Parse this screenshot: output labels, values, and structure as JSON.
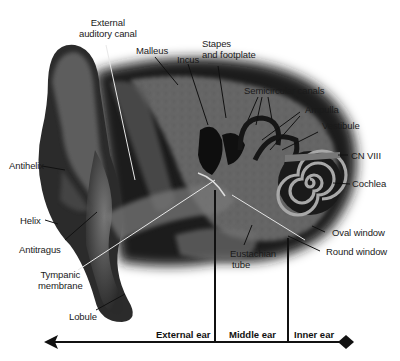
{
  "labels": {
    "external_auditory_canal": "External\nauditory canal",
    "external_auditory_canal_l1": "External",
    "external_auditory_canal_l2": "auditory canal",
    "malleus": "Malleus",
    "incus": "Incus",
    "stapes_l1": "Stapes",
    "stapes_l2": "and footplate",
    "semicircular_canals": "Semicircular canals",
    "ampulla": "Ampulla",
    "vestibule": "Vestibule",
    "cn_viii": "CN VIII",
    "cochlea": "Cochlea",
    "oval_window": "Oval window",
    "round_window": "Round window",
    "eustachian_l1": "Eustachian",
    "eustachian_l2": "tube",
    "antihelix": "Antihelix",
    "helix": "Helix",
    "antitragus": "Antitragus",
    "tympanic_l1": "Tympanic",
    "tympanic_l2": "membrane",
    "lobule": "Lobule"
  },
  "regions": {
    "external": "External ear",
    "middle": "Middle ear",
    "inner": "Inner ear"
  },
  "colors": {
    "background": "#ffffff",
    "ear_dark": "#1c1c1c",
    "ear_mid": "#4a4a4a",
    "bone": "#8a8a8a",
    "line": "#111111"
  }
}
